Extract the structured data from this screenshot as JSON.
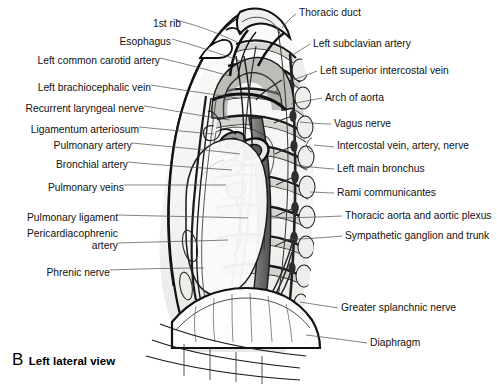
{
  "figure": {
    "panel_letter": "B",
    "caption": "Left lateral view",
    "view_type": "anatomical illustration",
    "style": "grayscale line and wash drawing"
  },
  "palette": {
    "background": "#ffffff",
    "ink": "#111111",
    "leader_line": "#4a4a4a",
    "wash_light": "#f2f1ef",
    "wash_mid": "#c9c8c5",
    "wash_dark": "#8a8a88",
    "wash_darkest": "#4e4e4d"
  },
  "labels_left": [
    {
      "id": "esophagus",
      "text": "Esophagus",
      "x": 131,
      "y": 42,
      "tip_x": 243,
      "tip_y": 62
    },
    {
      "id": "left-common-carotid-artery",
      "text": "Left common carotid artery",
      "x": 36,
      "y": 61,
      "tip_x": 230,
      "tip_y": 76
    },
    {
      "id": "left-brachiocephalic-vein",
      "text": "Left brachiocephalic vein",
      "x": 36,
      "y": 88,
      "tip_x": 238,
      "tip_y": 98
    },
    {
      "id": "recurrent-laryngeal-nerve",
      "text": "Recurrent laryngeal nerve",
      "x": 23,
      "y": 109,
      "tip_x": 230,
      "tip_y": 120
    },
    {
      "id": "ligamentum-arteriosum",
      "text": "Ligamentum arteriosum",
      "x": 25,
      "y": 130,
      "tip_x": 214,
      "tip_y": 134
    },
    {
      "id": "pulmonary-artery",
      "text": "Pulmonary artery",
      "x": 45,
      "y": 146,
      "tip_x": 240,
      "tip_y": 154
    },
    {
      "id": "bronchial-artery",
      "text": "Bronchial artery",
      "x": 51,
      "y": 165,
      "tip_x": 232,
      "tip_y": 170
    },
    {
      "id": "pulmonary-veins",
      "text": "Pulmonary veins",
      "x": 36,
      "y": 188,
      "tip_x": 226,
      "tip_y": 185
    },
    {
      "id": "pulmonary-ligament",
      "text": "Pulmonary ligament",
      "x": 11,
      "y": 215,
      "tip_x": 248,
      "tip_y": 218
    },
    {
      "id": "pericardiacophrenic-artery",
      "text": "Pericardiacophrenic\nartery",
      "x": 9,
      "y": 237,
      "tip_x": 228,
      "tip_y": 240
    },
    {
      "id": "phrenic-nerve",
      "text": "Phrenic nerve",
      "x": 29,
      "y": 273,
      "tip_x": 204,
      "tip_y": 268
    }
  ],
  "labels_right": [
    {
      "id": "thoracic-duct",
      "text": "Thoracic duct",
      "x": 299,
      "y": 12,
      "tip_x": 282,
      "tip_y": 28
    },
    {
      "id": "left-subclavian-artery",
      "text": "Left subclavian artery",
      "x": 313,
      "y": 41,
      "tip_x": 291,
      "tip_y": 56
    },
    {
      "id": "left-superior-intercostal-vein",
      "text": "Left superior intercostal vein",
      "x": 320,
      "y": 68,
      "tip_x": 293,
      "tip_y": 80
    },
    {
      "id": "arch-of-aorta",
      "text": "Arch of aorta",
      "x": 325,
      "y": 95,
      "tip_x": 291,
      "tip_y": 104
    },
    {
      "id": "vagus-nerve",
      "text": "Vagus nerve",
      "x": 334,
      "y": 121,
      "tip_x": 300,
      "tip_y": 122
    },
    {
      "id": "intercostal-vein-artery-nerve",
      "text": "Intercostal vein, artery, nerve",
      "x": 337,
      "y": 144,
      "tip_x": 312,
      "tip_y": 145
    },
    {
      "id": "left-main-bronchus",
      "text": "Left main bronchus",
      "x": 337,
      "y": 166,
      "tip_x": 296,
      "tip_y": 165
    },
    {
      "id": "rami-communicantes",
      "text": "Rami communicantes",
      "x": 337,
      "y": 190,
      "tip_x": 310,
      "tip_y": 192
    },
    {
      "id": "thoracic-aorta-and-aortic-plexus",
      "text": "Thoracic aorta and aortic plexus",
      "x": 345,
      "y": 213,
      "tip_x": 268,
      "tip_y": 218
    },
    {
      "id": "sympathetic-ganglion-and-trunk",
      "text": "Sympathetic ganglion and trunk",
      "x": 345,
      "y": 233,
      "tip_x": 282,
      "tip_y": 240
    },
    {
      "id": "greater-splanchnic-nerve",
      "text": "Greater splanchnic nerve",
      "x": 341,
      "y": 305,
      "tip_x": 300,
      "tip_y": 302
    },
    {
      "id": "diaphragm",
      "text": "Diaphragm",
      "x": 370,
      "y": 340,
      "tip_x": 306,
      "tip_y": 335
    }
  ],
  "structures": [
    "1st rib",
    "esophagus",
    "left common carotid artery",
    "left brachiocephalic vein",
    "recurrent laryngeal nerve",
    "ligamentum arteriosum",
    "pulmonary artery",
    "bronchial artery",
    "pulmonary veins",
    "pulmonary ligament",
    "pericardiacophrenic artery",
    "phrenic nerve",
    "thoracic duct",
    "left subclavian artery",
    "left superior intercostal vein",
    "arch of aorta",
    "vagus nerve",
    "intercostal vein, artery, nerve",
    "left main bronchus",
    "rami communicantes",
    "thoracic aorta and aortic plexus",
    "sympathetic ganglion and trunk",
    "greater splanchnic nerve",
    "diaphragm"
  ],
  "top_label": {
    "id": "first-rib",
    "text": "1st rib",
    "x": 179,
    "y": 24,
    "tip_x": 237,
    "tip_y": 42
  }
}
